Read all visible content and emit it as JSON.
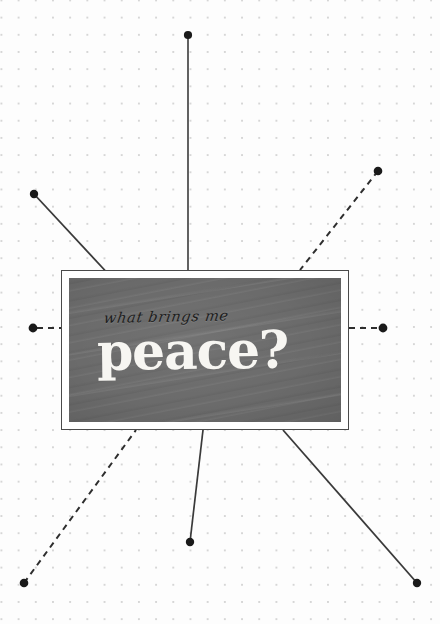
{
  "poster": {
    "width": 440,
    "height": 624,
    "background_color": "#fdfdfd",
    "dot_color": "#d6d6d6",
    "dot_spacing_px": 17
  },
  "card": {
    "frame_border_color": "#4a4a4a",
    "frame_fill_color": "#ffffff",
    "panel_color": "#6b6b6b",
    "script_text": "what brings me",
    "script_color": "#1d1d1d",
    "headline_text": "peace?",
    "headline_color": "#f7f6f2",
    "bounds": {
      "x": 61,
      "y": 270,
      "width": 288,
      "height": 160
    }
  },
  "connectors": {
    "line_color": "#3a3a3a",
    "dot_color": "#1a1a1a",
    "items": [
      {
        "name": "connector-top-vertical",
        "style": "solid",
        "from": {
          "x": 188,
          "y": 35
        },
        "to": {
          "x": 188,
          "y": 270
        },
        "endpoint_dot": "from"
      },
      {
        "name": "connector-upper-left-diagonal",
        "style": "solid",
        "from": {
          "x": 34,
          "y": 194
        },
        "to": {
          "x": 112,
          "y": 278
        },
        "endpoint_dot": "from"
      },
      {
        "name": "connector-upper-right-diagonal",
        "style": "dashed",
        "from": {
          "x": 378,
          "y": 171
        },
        "to": {
          "x": 300,
          "y": 270
        },
        "endpoint_dot": "from"
      },
      {
        "name": "connector-left-horizontal",
        "style": "dashed",
        "from": {
          "x": 33,
          "y": 328
        },
        "to": {
          "x": 61,
          "y": 328
        },
        "endpoint_dot": "from"
      },
      {
        "name": "connector-right-horizontal",
        "style": "dashed",
        "from": {
          "x": 383,
          "y": 328
        },
        "to": {
          "x": 349,
          "y": 328
        },
        "endpoint_dot": "from"
      },
      {
        "name": "connector-lower-left-diagonal",
        "style": "dashed",
        "from": {
          "x": 24,
          "y": 583
        },
        "to": {
          "x": 136,
          "y": 430
        },
        "endpoint_dot": "from"
      },
      {
        "name": "connector-bottom-vertical",
        "style": "solid",
        "from": {
          "x": 190,
          "y": 542
        },
        "to": {
          "x": 203,
          "y": 430
        },
        "endpoint_dot": "from"
      },
      {
        "name": "connector-lower-right-diagonal",
        "style": "solid",
        "from": {
          "x": 417,
          "y": 583
        },
        "to": {
          "x": 283,
          "y": 430
        },
        "endpoint_dot": "from"
      }
    ]
  }
}
